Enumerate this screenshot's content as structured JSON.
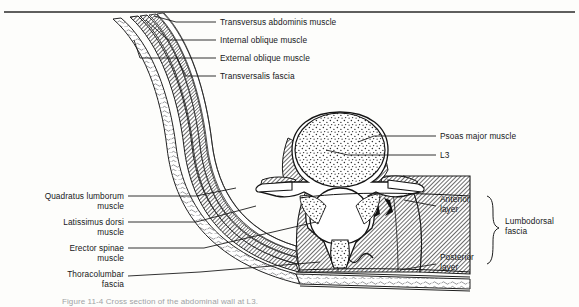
{
  "figure": {
    "top_rule": true,
    "background_color": "#fdfdfb",
    "ink_color": "#17181a",
    "hatch_color": "#3a3a3a",
    "signature": "J. V. S."
  },
  "caption": {
    "text": "Figure 11-4  Cross section of the abdominal wall at L3."
  },
  "labels_top_left": [
    {
      "id": "transversus-abdominis",
      "text": "Transversus abdominis muscle"
    },
    {
      "id": "internal-oblique",
      "text": "Internal oblique muscle"
    },
    {
      "id": "external-oblique",
      "text": "External oblique muscle"
    },
    {
      "id": "transversalis-fascia",
      "text": "Transversalis fascia"
    }
  ],
  "labels_right": [
    {
      "id": "psoas-major",
      "text": "Psoas major muscle"
    },
    {
      "id": "l3",
      "text": "L3"
    },
    {
      "id": "anterior-layer",
      "text": "Anterior\nlayer"
    },
    {
      "id": "posterior-layer",
      "text": "Posterior\nlayer"
    }
  ],
  "labels_left": [
    {
      "id": "quadratus-lumborum",
      "text": "Quadratus lumborum\nmuscle"
    },
    {
      "id": "latissimus-dorsi",
      "text": "Latissimus dorsi\nmuscle"
    },
    {
      "id": "erector-spinae",
      "text": "Erector spinae\nmuscle"
    },
    {
      "id": "thoracolumbar-fascia",
      "text": "Thoracolumbar\nfascia"
    }
  ],
  "brace_group": {
    "id": "lumbodorsal-fascia",
    "text": "Lumbodorsal\nfascia",
    "members": [
      "Anterior layer",
      "Posterior layer"
    ]
  }
}
